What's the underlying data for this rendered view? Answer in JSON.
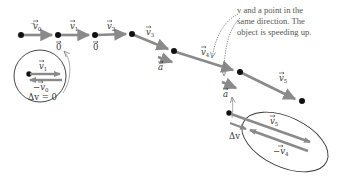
{
  "diagram": {
    "colors": {
      "vector": "#8a8a8a",
      "dot": "#111111",
      "outline": "#333333",
      "text": "#333333",
      "note_text": "#555555",
      "leader": "#888888"
    },
    "velocity_labels": {
      "v0": {
        "base": "v",
        "sub": "0"
      },
      "v1": {
        "base": "v",
        "sub": "1"
      },
      "v2": {
        "base": "v",
        "sub": "2"
      },
      "v3": {
        "base": "v",
        "sub": "3"
      },
      "v4": {
        "base": "v",
        "sub": "4"
      },
      "v5": {
        "base": "v",
        "sub": "5"
      }
    },
    "zero_labels": [
      "0",
      "0"
    ],
    "accel_label": "a",
    "annotation": {
      "line1": "v and a point in the",
      "line2": "same direction. The",
      "line3": "object is speeding up."
    },
    "inset_left": {
      "top_label": {
        "base": "v",
        "sub": "1"
      },
      "bottom_label": {
        "prefix": "−",
        "base": "v",
        "sub": "0"
      },
      "result": "Δv = 0"
    },
    "inset_right": {
      "top_label": {
        "base": "v",
        "sub": "5"
      },
      "bottom_label": {
        "prefix": "−",
        "base": "v",
        "sub": "4"
      },
      "delta_label": "Δv"
    }
  }
}
